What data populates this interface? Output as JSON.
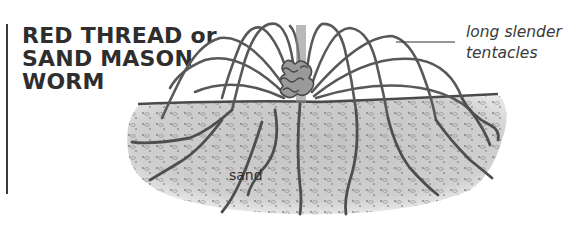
{
  "title": {
    "lines": [
      "RED THREAD or",
      "SAND MASON",
      "WORM"
    ]
  },
  "labels": {
    "tentacles": [
      "long slender",
      "tentacles"
    ],
    "sand": "sand"
  },
  "colors": {
    "text": "#2e2e2e",
    "sand": "#c9c9c9",
    "tentacle": "#555555",
    "rule": "#3a3a3a"
  }
}
